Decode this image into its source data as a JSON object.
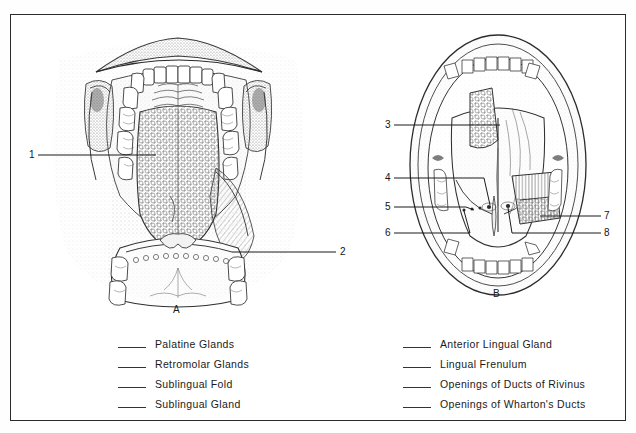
{
  "figure": {
    "panel_a_caption": "A",
    "panel_b_caption": "B",
    "panel_a_description": "Open mouth anterior view showing hard palate with rugae, upper and lower dental arches, dorsum of tongue and floor of mouth",
    "panel_b_description": "Inferior surface of tongue and floor of mouth showing lingual frenulum, sublingual folds and duct openings"
  },
  "leaders": {
    "n1": "1",
    "n2": "2",
    "n3": "3",
    "n4": "4",
    "n5": "5",
    "n6": "6",
    "n7": "7",
    "n8": "8"
  },
  "legend_left": [
    {
      "label": "Palatine Glands"
    },
    {
      "label": "Retromolar Glands"
    },
    {
      "label": "Sublingual Fold"
    },
    {
      "label": "Sublingual Gland"
    }
  ],
  "legend_right": [
    {
      "label": "Anterior Lingual Gland"
    },
    {
      "label": "Lingual Frenulum"
    },
    {
      "label": "Openings of Ducts of Rivinus"
    },
    {
      "label": "Openings of Wharton's Ducts"
    }
  ],
  "colors": {
    "ink": "#1a1a1a",
    "frame": "#2b2b2b",
    "paper": "#ffffff",
    "stipple": "#8d8d8d"
  }
}
